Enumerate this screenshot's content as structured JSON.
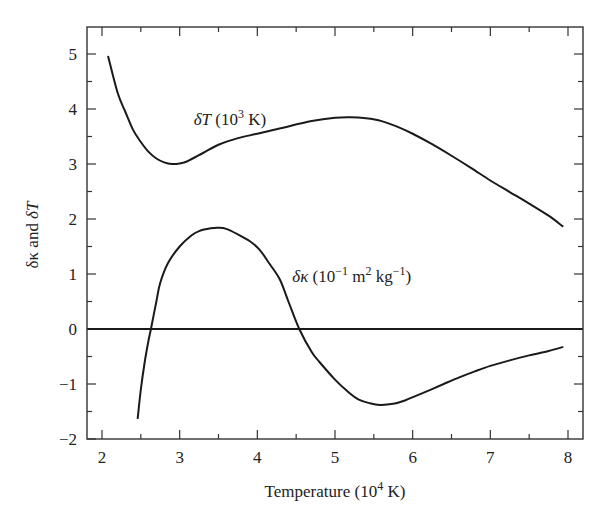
{
  "chart_data": {
    "type": "line",
    "title": "",
    "xlabel": {
      "main": "Temperature (10",
      "sup": "4",
      "tail": " K)"
    },
    "ylabel": {
      "parts": [
        "δκ",
        " and ",
        "δT"
      ]
    },
    "xlim": [
      1.8,
      8.2
    ],
    "ylim": [
      -2,
      5.5
    ],
    "xticks": [
      2,
      3,
      4,
      5,
      6,
      7,
      8
    ],
    "xtick_labels": [
      "2",
      "3",
      "4",
      "5",
      "6",
      "7",
      "8"
    ],
    "yticks": [
      -2,
      -1,
      0,
      1,
      2,
      3,
      4,
      5
    ],
    "ytick_labels": [
      "−2",
      "−1",
      "0",
      "1",
      "2",
      "3",
      "4",
      "5"
    ],
    "minor_tick_step": 0.5,
    "grid": false,
    "reference_line": {
      "y": 0
    },
    "series": [
      {
        "name": "δT (10³ K)",
        "x": [
          2.08,
          2.2,
          2.3,
          2.4,
          2.5,
          2.6,
          2.7,
          2.8,
          2.9,
          3.0,
          3.1,
          3.3,
          3.5,
          3.75,
          4.0,
          4.3,
          4.7,
          5.0,
          5.2,
          5.4,
          5.6,
          5.8,
          6.0,
          6.25,
          6.5,
          6.75,
          7.0,
          7.25,
          7.5,
          7.75,
          7.93
        ],
        "values": [
          4.95,
          4.3,
          3.95,
          3.62,
          3.4,
          3.22,
          3.1,
          3.03,
          3.0,
          3.01,
          3.05,
          3.2,
          3.35,
          3.47,
          3.55,
          3.65,
          3.78,
          3.84,
          3.85,
          3.83,
          3.78,
          3.68,
          3.55,
          3.36,
          3.15,
          2.93,
          2.7,
          2.49,
          2.28,
          2.06,
          1.87
        ]
      },
      {
        "name": "δκ (10⁻¹ m² kg⁻¹)",
        "x": [
          2.46,
          2.5,
          2.55,
          2.6,
          2.63,
          2.7,
          2.75,
          2.85,
          3.0,
          3.15,
          3.25,
          3.4,
          3.5,
          3.6,
          3.75,
          3.9,
          4.03,
          4.15,
          4.29,
          4.4,
          4.54,
          4.7,
          4.8,
          5.0,
          5.15,
          5.3,
          5.45,
          5.58,
          5.75,
          5.9,
          6.05,
          6.22,
          6.4,
          6.6,
          6.8,
          7.0,
          7.25,
          7.5,
          7.75,
          7.93
        ],
        "values": [
          -1.62,
          -1.1,
          -0.6,
          -0.2,
          0.0,
          0.5,
          0.84,
          1.2,
          1.5,
          1.7,
          1.78,
          1.83,
          1.84,
          1.82,
          1.72,
          1.6,
          1.44,
          1.2,
          0.9,
          0.5,
          0.0,
          -0.42,
          -0.6,
          -0.92,
          -1.12,
          -1.28,
          -1.35,
          -1.38,
          -1.36,
          -1.3,
          -1.21,
          -1.11,
          -1.0,
          -0.88,
          -0.77,
          -0.67,
          -0.57,
          -0.48,
          -0.4,
          -0.33
        ]
      }
    ],
    "annotations": [
      {
        "for_series": 0,
        "x": 3.18,
        "y": 3.75,
        "label": "δT",
        "open": " (10",
        "sup": "3",
        "close": " K)"
      },
      {
        "for_series": 1,
        "x": 4.45,
        "y": 0.85,
        "label": "δκ",
        "open": " (10",
        "sup": "−1",
        "mid": " m",
        "sup2": "2",
        "mid2": " kg",
        "sup3": "−1",
        "close": ")"
      }
    ]
  }
}
